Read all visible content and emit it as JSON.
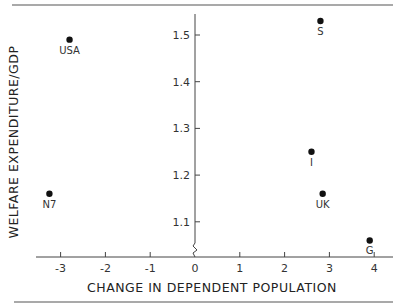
{
  "chart_data": {
    "type": "scatter",
    "title": "",
    "xlabel": "CHANGE IN DEPENDENT POPULATION",
    "ylabel": "WELFARE EXPENDITURE/GDP",
    "xlim": [
      -3.5,
      4.3
    ],
    "ylim": [
      1.03,
      1.56
    ],
    "x_ticks": [
      -3,
      -2,
      -1,
      0,
      1,
      2,
      3,
      4
    ],
    "x_tick_labels": [
      "-3",
      "-2",
      "-1",
      "0",
      "1",
      "2",
      "3",
      "4"
    ],
    "y_ticks": [
      1.1,
      1.2,
      1.3,
      1.4,
      1.5
    ],
    "y_tick_labels": [
      "1.1",
      "1.2",
      "1.3",
      "1.4",
      "1.5"
    ],
    "y_axis_break": true,
    "grid": false,
    "points": [
      {
        "label": "USA",
        "x": -2.8,
        "y": 1.49
      },
      {
        "label": "S",
        "x": 2.8,
        "y": 1.53
      },
      {
        "label": "I",
        "x": 2.6,
        "y": 1.25
      },
      {
        "label": "UK",
        "x": 2.85,
        "y": 1.16
      },
      {
        "label": "G",
        "x": 3.9,
        "y": 1.06
      },
      {
        "label": "N7",
        "x": -3.25,
        "y": 1.16
      }
    ]
  }
}
